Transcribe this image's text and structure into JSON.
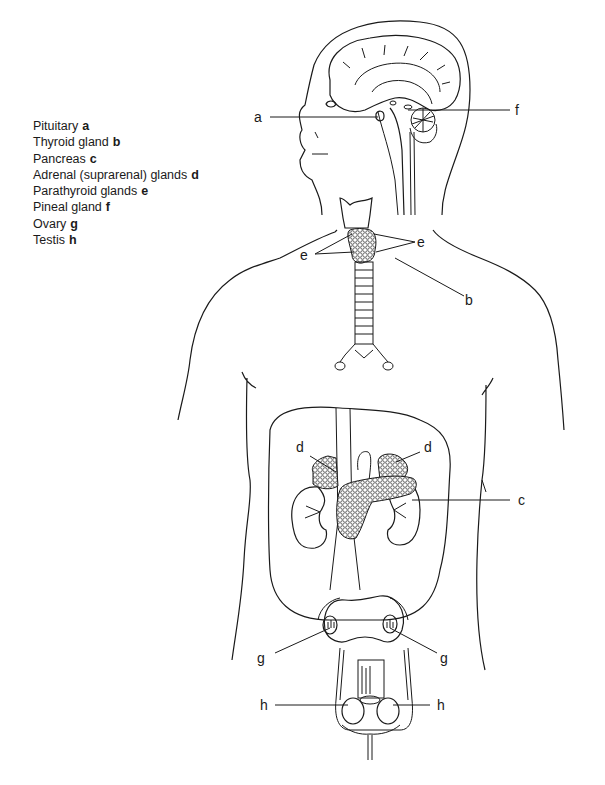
{
  "legend": [
    {
      "name": "Pituitary",
      "key": "a"
    },
    {
      "name": "Thyroid gland",
      "key": "b"
    },
    {
      "name": "Pancreas",
      "key": "c"
    },
    {
      "name": "Adrenal (suprarenal) glands",
      "key": "d"
    },
    {
      "name": "Parathyroid glands",
      "key": "e"
    },
    {
      "name": "Pineal gland",
      "key": "f"
    },
    {
      "name": "Ovary",
      "key": "g"
    },
    {
      "name": "Testis",
      "key": "h"
    }
  ],
  "labels": {
    "a": "a",
    "b": "b",
    "c": "c",
    "d_left": "d",
    "d_right": "d",
    "e_left": "e",
    "e_right": "e",
    "f": "f",
    "g_left": "g",
    "g_right": "g",
    "h_left": "h",
    "h_right": "h"
  }
}
